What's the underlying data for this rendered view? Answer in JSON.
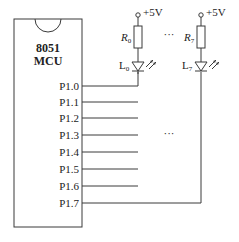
{
  "diagram": {
    "type": "circuit-schematic",
    "chip": {
      "label_line1": "8051",
      "label_line2": "MCU",
      "pins": [
        {
          "label": "P1.0",
          "y": 86,
          "connected_to": "L0"
        },
        {
          "label": "P1.1",
          "y": 102,
          "connected_to": null
        },
        {
          "label": "P1.2",
          "y": 118,
          "connected_to": null
        },
        {
          "label": "P1.3",
          "y": 135,
          "connected_to": null
        },
        {
          "label": "P1.4",
          "y": 152,
          "connected_to": null
        },
        {
          "label": "P1.5",
          "y": 169,
          "connected_to": null
        },
        {
          "label": "P1.6",
          "y": 186,
          "connected_to": null
        },
        {
          "label": "P1.7",
          "y": 203,
          "connected_to": "L7"
        }
      ]
    },
    "branches": [
      {
        "supply": "+5V",
        "resistor": "R",
        "resistor_sub": "0",
        "led": "L",
        "led_sub": "0"
      },
      {
        "supply": "+5V",
        "resistor": "R",
        "resistor_sub": "7",
        "led": "L",
        "led_sub": "7"
      }
    ],
    "ellipsis_top": "···",
    "ellipsis_middle": "···",
    "colors": {
      "line": "#3a3a3a",
      "text": "#222222",
      "background": "#ffffff"
    }
  }
}
